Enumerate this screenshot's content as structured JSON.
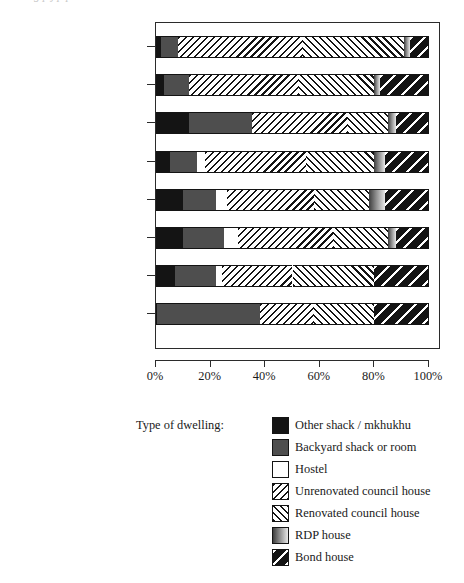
{
  "top_clipped_text": "g p j p    p",
  "legend_title": "Type of dwelling:",
  "axis": {
    "x_ticks": [
      "0%",
      "20%",
      "40%",
      "60%",
      "80%",
      "100%"
    ],
    "x_tick_values": [
      0,
      20,
      40,
      60,
      80,
      100
    ]
  },
  "chart_data": {
    "type": "bar",
    "orientation": "horizontal",
    "stacked": true,
    "stack_mode": "percent",
    "title": "",
    "xlabel": "",
    "ylabel": "",
    "xlim": [
      0,
      100
    ],
    "grid": false,
    "legend_position": "bottom",
    "legend_title": "Type of dwelling:",
    "categories": [
      "Disabled, on pension, etc",
      "Student",
      "Petty bourgeois",
      "Fill-ins",
      "Unemployed",
      "Paritally employed",
      "Employed",
      "Employed middle class"
    ],
    "series": [
      {
        "name": "Other shack / mkhukhu",
        "pattern": "solid-black",
        "color": "#141414",
        "values": [
          2,
          3,
          12,
          5,
          10,
          10,
          7,
          0
        ]
      },
      {
        "name": "Backyard shack or room",
        "pattern": "solid-darkgray",
        "color": "#4e4e4e",
        "values": [
          6,
          9,
          23,
          10,
          12,
          15,
          15,
          38
        ]
      },
      {
        "name": "Hostel",
        "pattern": "solid-white",
        "color": "#ffffff",
        "values": [
          0,
          0,
          0,
          3,
          4,
          5,
          2,
          0
        ]
      },
      {
        "name": "Unrenovated council house",
        "pattern": "hatch-backslash",
        "color": "#ffffff",
        "values": [
          46,
          40,
          35,
          37,
          32,
          35,
          26,
          20
        ]
      },
      {
        "name": "Renovated council house",
        "pattern": "hatch-slash",
        "color": "#ffffff",
        "values": [
          37,
          28,
          15,
          25,
          20,
          20,
          30,
          22
        ]
      },
      {
        "name": "RDP house",
        "pattern": "gradient-gray",
        "color": "#8d8d8d",
        "values": [
          2,
          2,
          3,
          4,
          6,
          3,
          0,
          0
        ]
      },
      {
        "name": "Bond house",
        "pattern": "black-white-stripe",
        "color": "#141414",
        "values": [
          7,
          18,
          12,
          16,
          16,
          12,
          20,
          20
        ]
      }
    ]
  }
}
